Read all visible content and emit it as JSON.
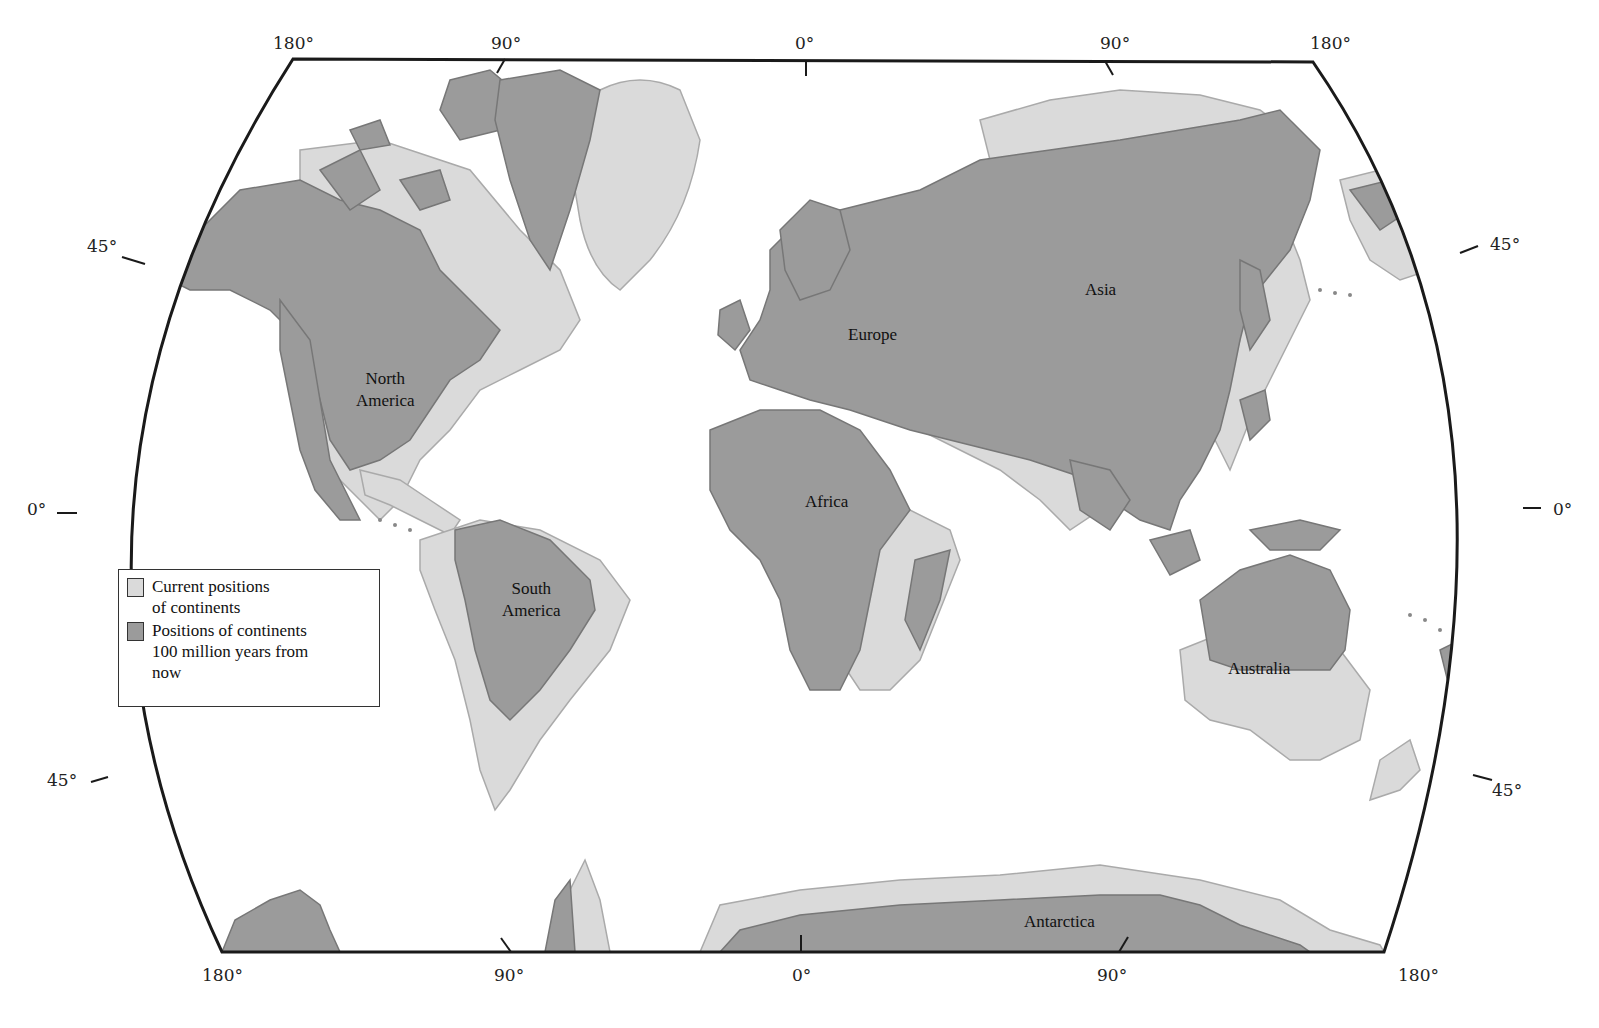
{
  "map": {
    "title": "",
    "projection_labels": {
      "top": [
        "180°",
        "90°",
        "0°",
        "90°",
        "180°"
      ],
      "bottom": [
        "180°",
        "90°",
        "0°",
        "90°",
        "180°"
      ],
      "left": [
        "45°",
        "0°",
        "45°"
      ],
      "right": [
        "45°",
        "0°",
        "45°"
      ]
    },
    "continents": {
      "north_america": "North America",
      "north_america_line1": "North",
      "north_america_line2": "America",
      "south_america_line1": "South",
      "south_america_line2": "America",
      "europe": "Europe",
      "asia": "Asia",
      "africa": "Africa",
      "australia": "Australia",
      "antarctica": "Antarctica"
    },
    "legend": {
      "items": [
        {
          "label_line1": "Current positions",
          "label_line2": "of continents",
          "color": "#dadada"
        },
        {
          "label_line1": "Positions of continents",
          "label_line2": "100 million years from",
          "label_line3": "now",
          "color": "#9b9b9b"
        }
      ]
    },
    "colors": {
      "current": "#dadada",
      "future": "#9b9b9b",
      "outline": "#1a1a1a",
      "coast_current": "#aaaaaa",
      "coast_future": "#777777"
    }
  }
}
